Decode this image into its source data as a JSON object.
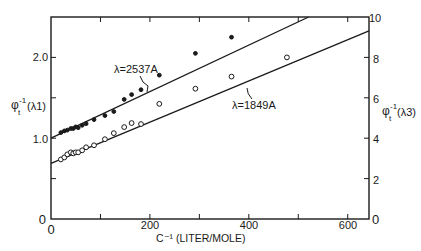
{
  "chart_data": {
    "type": "scatter",
    "title": "",
    "xlabel": "C⁻¹ (LITER/MOLE)",
    "ylabel_left": "φt⁻¹(λ1)",
    "ylabel_right": "φt⁻¹(λ3)",
    "xlim": [
      0,
      643
    ],
    "ylim_left": [
      0,
      2.5
    ],
    "ylim_right": [
      0,
      10
    ],
    "x_ticks": [
      0,
      100,
      200,
      300,
      400,
      500,
      600
    ],
    "x_tick_labels": [
      "0",
      "200",
      "400",
      "600"
    ],
    "y_left_tick_labels": [
      "0",
      "1.0",
      "2.0"
    ],
    "y_right_tick_labels": [
      "0",
      "2",
      "4",
      "6",
      "8",
      "10"
    ],
    "grid": false,
    "series": [
      {
        "name": "λ=2537A",
        "axis": "left",
        "marker": "filled-circle",
        "fit_line": {
          "intercept": 1.0,
          "slope": 0.00288
        },
        "x": [
          20,
          27,
          33,
          40,
          45,
          50,
          55,
          63,
          71,
          87,
          109,
          127,
          148,
          163,
          182,
          219,
          292,
          365
        ],
        "y": [
          1.07,
          1.09,
          1.1,
          1.12,
          1.12,
          1.14,
          1.13,
          1.16,
          1.18,
          1.23,
          1.28,
          1.33,
          1.48,
          1.54,
          1.6,
          1.78,
          2.05,
          2.25
        ]
      },
      {
        "name": "λ=1849A",
        "axis": "right",
        "marker": "open-circle",
        "fit_line": {
          "intercept": 2.75,
          "slope": 0.0102
        },
        "x": [
          20,
          27,
          33,
          40,
          45,
          50,
          55,
          63,
          71,
          87,
          109,
          127,
          148,
          163,
          182,
          219,
          292,
          365,
          477
        ],
        "y": [
          2.95,
          3.05,
          3.2,
          3.3,
          3.25,
          3.3,
          3.3,
          3.4,
          3.55,
          3.65,
          3.95,
          4.25,
          4.55,
          4.75,
          4.7,
          5.7,
          6.45,
          7.05,
          8.0
        ]
      }
    ],
    "annotations": [
      "λ=2537A",
      "λ=1849A"
    ]
  },
  "labels": {
    "x_axis": "C⁻¹ (LITER/MOLE)",
    "y_left_main": "φ",
    "y_left_sup": "-1",
    "y_left_sub": "t",
    "y_left_arg": "(λ1)",
    "y_right_main": "φ",
    "y_right_sup": "-1",
    "y_right_sub": "t",
    "y_right_arg": "(λ3)",
    "series1_label": "λ=2537A",
    "series2_label": "λ=1849A",
    "x_tick_0": "0",
    "x_tick_200": "200",
    "x_tick_400": "400",
    "x_tick_600": "600",
    "yl_tick_0": "0",
    "yl_tick_1": "1.0",
    "yl_tick_2": "2.0",
    "yr_tick_0": "0",
    "yr_tick_2": "2",
    "yr_tick_4": "4",
    "yr_tick_6": "6",
    "yr_tick_8": "8",
    "yr_tick_10": "10"
  }
}
